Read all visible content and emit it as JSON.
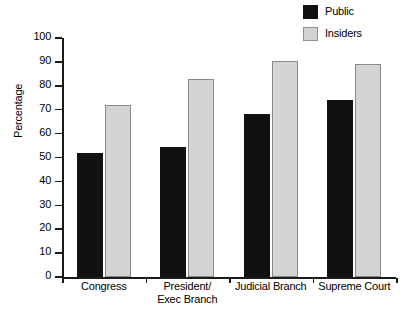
{
  "chart_data": {
    "type": "bar",
    "title": "",
    "subtitle": "",
    "xlabel": "",
    "ylabel": "Percentage",
    "categories": [
      "Congress",
      "President/\nExec Branch",
      "Judicial Branch",
      "Supreme Court"
    ],
    "series": [
      {
        "name": "Public",
        "color": "#111111",
        "values": [
          52,
          54.5,
          68,
          74
        ]
      },
      {
        "name": "Insiders",
        "color": "#d4d4d4",
        "values": [
          72,
          83,
          90.5,
          89
        ]
      }
    ],
    "ylim": [
      0,
      100
    ],
    "ytick_labels": [
      "100",
      "90",
      "80",
      "70",
      "60",
      "50",
      "40",
      "30",
      "20",
      "10",
      "0"
    ],
    "ytick_values": [
      100,
      90,
      80,
      70,
      60,
      50,
      40,
      30,
      20,
      10,
      0
    ],
    "grid": false,
    "legend_position": "top-right",
    "legend_entries": [
      "Public",
      "Insiders"
    ]
  },
  "colors": {
    "public": "#111111",
    "insiders": "#d4d4d4",
    "insiders_border": "#8a8a8a",
    "axis": "#1a1a1a",
    "background": "#ffffff"
  },
  "footer": {
    "artifact_text": ""
  }
}
